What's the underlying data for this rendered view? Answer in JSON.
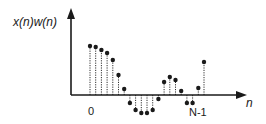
{
  "labels": {
    "y_axis": "x(n)w(n)",
    "x_axis": "n",
    "tick_start": "0",
    "tick_end": "N-1"
  },
  "colors": {
    "stroke": "#1a1a1a",
    "background": "#ffffff"
  },
  "chart_data": {
    "type": "stem",
    "title": "",
    "xlabel": "n",
    "ylabel": "x(n)w(n)",
    "x_ticks": [
      "0",
      "N-1"
    ],
    "n": [
      0,
      1,
      2,
      3,
      4,
      5,
      6,
      7,
      8,
      9,
      10,
      11,
      12,
      13,
      14,
      15,
      16,
      17,
      18,
      19,
      20
    ],
    "values": [
      49,
      48,
      45,
      42,
      35,
      20,
      6,
      -8,
      -15,
      -18,
      -18,
      -15,
      -4,
      13,
      18,
      15,
      4,
      -8,
      -8,
      7,
      33
    ],
    "stem_style": "dotted",
    "marker": "filled-circle",
    "grid": false
  },
  "layout": {
    "origin_x": 71,
    "baseline_y": 95,
    "first_x": 90,
    "spacing": 5.7,
    "x_axis_end": 247,
    "y_axis_top": 8
  }
}
